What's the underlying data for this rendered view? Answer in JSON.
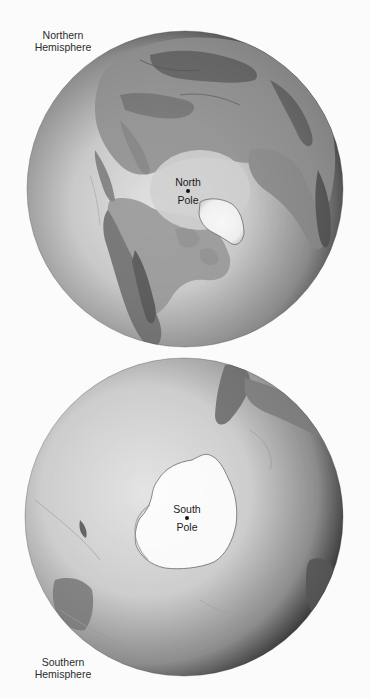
{
  "figure": {
    "northern": {
      "hemisphere_label_line1": "Northern",
      "hemisphere_label_line2": "Hemisphere",
      "pole_label_line1": "North",
      "pole_label_line2": "Pole",
      "globe": {
        "cx": 185,
        "cy": 189,
        "r": 158
      }
    },
    "southern": {
      "hemisphere_label_line1": "Southern",
      "hemisphere_label_line2": "Hemisphere",
      "pole_label_line1": "South",
      "pole_label_line2": "Pole",
      "globe": {
        "cx": 184,
        "cy": 517,
        "r": 159
      }
    },
    "colors": {
      "background": "#fbfbfb",
      "globe_highlight": "#e6e6e6",
      "globe_shadow": "#2a2a2a",
      "land": "#8e8e8e",
      "land_dark": "#5a5a5a",
      "ice": "#ffffff",
      "text": "#2c2c2c"
    }
  }
}
